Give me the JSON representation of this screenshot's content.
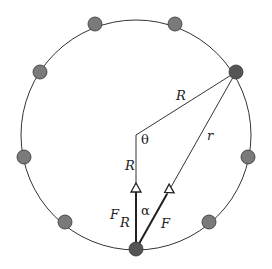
{
  "diagram": {
    "colors": {
      "line": "#333333",
      "particle": "#7a7a7a",
      "particle_dark": "#555555",
      "background": "#ffffff"
    },
    "labels": {
      "R_top": "R",
      "r": "r",
      "theta": "θ",
      "R_vertical": "R",
      "F_R": "F",
      "F_R_sub": "R",
      "alpha": "α",
      "F": "F"
    },
    "particles": [
      {
        "x": 95,
        "y": 24
      },
      {
        "x": 175,
        "y": 24
      },
      {
        "x": 40,
        "y": 72
      },
      {
        "x": 236,
        "y": 72
      },
      {
        "x": 24,
        "y": 157
      },
      {
        "x": 248,
        "y": 157
      },
      {
        "x": 65,
        "y": 222
      },
      {
        "x": 209,
        "y": 222
      },
      {
        "x": 136,
        "y": 249
      }
    ]
  }
}
